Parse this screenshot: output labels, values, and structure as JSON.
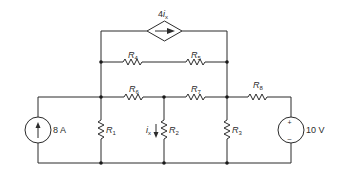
{
  "diagram": {
    "type": "circuit-schematic",
    "components": {
      "current_source": {
        "label": "8 A",
        "direction": "up"
      },
      "voltage_source": {
        "label": "10 V",
        "plus": "+",
        "minus": "–"
      },
      "dependent_source": {
        "label_main": "4",
        "label_var": "i",
        "label_sub": "x",
        "type": "CCCS",
        "direction": "right"
      },
      "resistors": [
        {
          "id": "R1",
          "main": "R",
          "sub": "1"
        },
        {
          "id": "R2",
          "main": "R",
          "sub": "2"
        },
        {
          "id": "R3",
          "main": "R",
          "sub": "3"
        },
        {
          "id": "R4",
          "main": "R",
          "sub": "4"
        },
        {
          "id": "R5",
          "main": "R",
          "sub": "5"
        },
        {
          "id": "R6",
          "main": "R",
          "sub": "6"
        },
        {
          "id": "R7",
          "main": "R",
          "sub": "7"
        },
        {
          "id": "R8",
          "main": "R",
          "sub": "8"
        }
      ],
      "current_label": {
        "var": "i",
        "sub": "x"
      }
    },
    "colors": {
      "wire": "#2b2b2b",
      "node": "#1a1a1a",
      "background": "#ffffff"
    }
  }
}
